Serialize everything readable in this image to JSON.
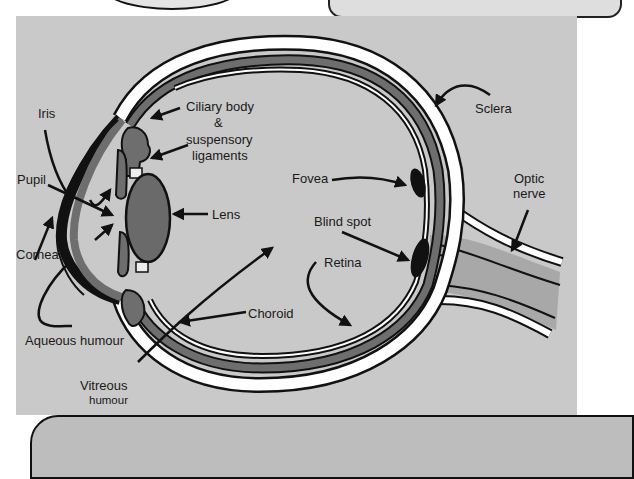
{
  "diagram": {
    "colors": {
      "background_panel": "#c9c9c9",
      "sclera": "#ffffff",
      "choroid": "#6e6e6e",
      "lens": "#6a6a6a",
      "outline": "#111111",
      "nerve": "#a8a8a8"
    },
    "labels": {
      "iris": "Iris",
      "pupil": "Pupil",
      "cornea": "Cornea",
      "aqueous_humour": "Aqueous humour",
      "vitreous_line1": "Vitreous",
      "vitreous_line2": "humour",
      "ciliary_line1": "Ciliary body",
      "ciliary_line2": "&",
      "ciliary_line3": "suspensory",
      "ciliary_line4": "ligaments",
      "lens": "Lens",
      "choroid": "Choroid",
      "fovea": "Fovea",
      "blind_spot": "Blind spot",
      "retina": "Retina",
      "sclera": "Sclera",
      "optic_line1": "Optic",
      "optic_line2": "nerve"
    }
  }
}
